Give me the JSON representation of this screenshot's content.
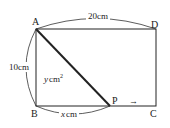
{
  "diagram": {
    "type": "geometry-rectangle-moving-point",
    "vertices": {
      "A": {
        "label": "A",
        "x": 36,
        "y": 29
      },
      "B": {
        "label": "B",
        "x": 36,
        "y": 106
      },
      "C": {
        "label": "C",
        "x": 156,
        "y": 106
      },
      "D": {
        "label": "D",
        "x": 156,
        "y": 29
      },
      "P": {
        "label": "P",
        "x": 110,
        "y": 106
      }
    },
    "dimensions": {
      "top": "20cm",
      "left": "10cm",
      "bottom_segment": "x cm",
      "bottom_var": "x",
      "bottom_unit": "cm"
    },
    "area_label": {
      "var": "y",
      "unit": "cm",
      "exponent": "2"
    },
    "motion_arrow": "→"
  }
}
